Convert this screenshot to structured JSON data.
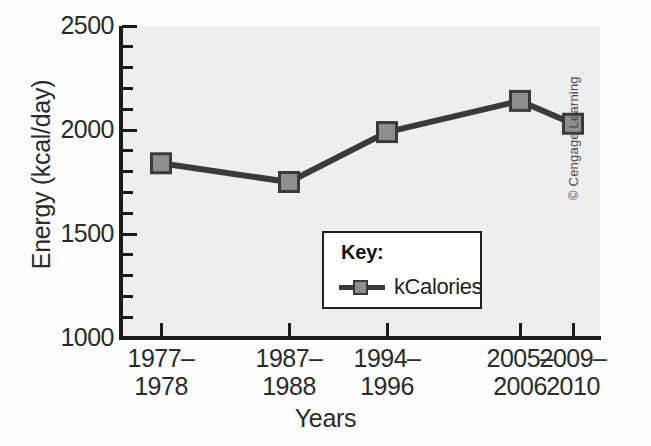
{
  "chart_data": {
    "type": "line",
    "title": "",
    "subtitle": "",
    "xlabel": "Years",
    "ylabel": "Energy (kcal/day)",
    "categories": [
      "1977–\n1978",
      "1987–\n1988",
      "1994–\n1996",
      "2005–\n2006",
      "2009–\n2010"
    ],
    "category_lines": [
      [
        "1977–",
        "1978"
      ],
      [
        "1987–",
        "1988"
      ],
      [
        "1994–",
        "1996"
      ],
      [
        "2005–",
        "2006"
      ],
      [
        "2009–",
        "2010"
      ]
    ],
    "series": [
      {
        "name": "kCalories",
        "values": [
          1840,
          1750,
          1990,
          2140,
          2030
        ],
        "color": "#8e8e8e",
        "line_color": "#3a3a3a",
        "marker": "square"
      }
    ],
    "ylim": [
      1000,
      2500
    ],
    "ytick_labels": [
      "2500",
      "2000",
      "1500",
      "1000"
    ],
    "ytick_values": [
      2500,
      2000,
      1500,
      1000
    ],
    "yminor_step": 100,
    "grid": false,
    "legend_position": "inside-center-bottom",
    "plot_background": "#eeeeee",
    "axis_color": "#1a1a1a"
  },
  "legend": {
    "title": "Key:",
    "entries": [
      {
        "label": "kCalories"
      }
    ]
  },
  "credit": {
    "text": "© Cengage Learning"
  }
}
